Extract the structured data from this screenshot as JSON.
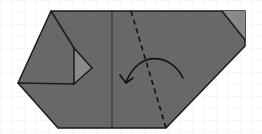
{
  "diagram": {
    "type": "origami-fold-step",
    "colors": {
      "background": "#ffffff",
      "grid": "#efefef",
      "paper": "#686868",
      "flap_light": "#8a8a8a",
      "line": "#1a1a1a"
    },
    "paper_outline": [
      [
        51,
        11
      ],
      [
        245,
        11
      ],
      [
        245,
        46
      ],
      [
        166,
        128
      ],
      [
        58,
        128
      ],
      [
        18,
        83
      ]
    ],
    "left_flap_lines": [
      [
        [
          51,
          11
        ],
        [
          74,
          48
        ]
      ],
      [
        [
          74,
          48
        ],
        [
          74,
          84
        ]
      ],
      [
        [
          18,
          83
        ],
        [
          74,
          84
        ]
      ]
    ],
    "left_flap_light_triangle": [
      [
        74,
        48
      ],
      [
        92,
        68
      ],
      [
        74,
        84
      ]
    ],
    "left_flap_triangle_edges": [
      [
        [
          74,
          48
        ],
        [
          92,
          68
        ]
      ],
      [
        [
          92,
          68
        ],
        [
          74,
          84
        ]
      ]
    ],
    "right_corner_light_triangle": [
      [
        222,
        11
      ],
      [
        245,
        11
      ],
      [
        245,
        40
      ]
    ],
    "right_corner_fold_line": [
      [
        222,
        11
      ],
      [
        245,
        40
      ]
    ],
    "vertical_crease": [
      [
        112,
        11
      ],
      [
        112,
        128
      ]
    ],
    "valley_fold_dashed": [
      [
        131,
        11
      ],
      [
        166,
        128
      ]
    ],
    "fold_arrow": {
      "path": "M183,78 C172,55 140,48 126,82",
      "head": [
        [
          120,
          75
        ],
        [
          126,
          83
        ],
        [
          133,
          78
        ]
      ],
      "direction": "right-to-left"
    }
  }
}
